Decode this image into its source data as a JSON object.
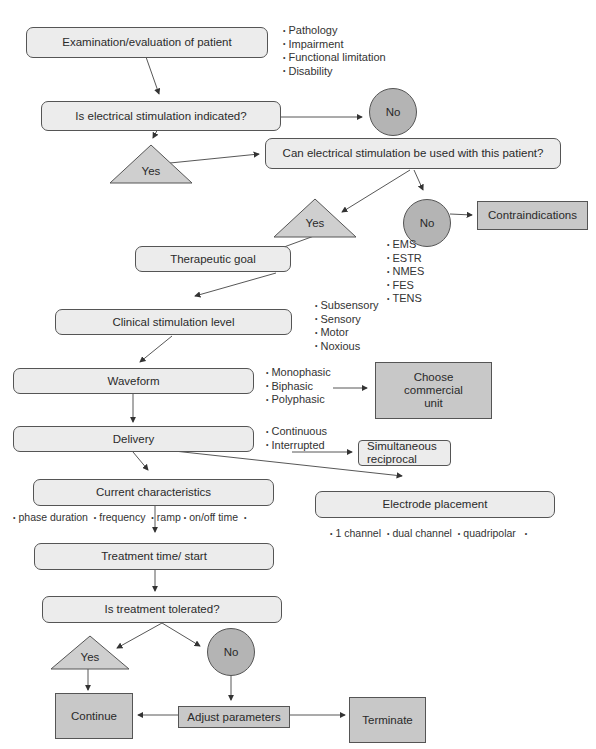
{
  "diagram": {
    "type": "flowchart",
    "colors": {
      "rounded_fill": "#ececec",
      "rect_fill": "#c8c8c8",
      "circle_fill": "#b4b4b4",
      "triangle_fill": "#cfcfcf",
      "stroke": "#555555"
    },
    "nodes": {
      "examination": "Examination/evaluation of patient",
      "es_indicated": "Is electrical stimulation indicated?",
      "no_1": "No",
      "yes_1": "Yes",
      "can_use": "Can electrical stimulation be used with this patient?",
      "yes_2": "Yes",
      "no_2": "No",
      "contraindications": "Contraindications",
      "therapeutic_goal": "Therapeutic goal",
      "clinical_level": "Clinical stimulation level",
      "waveform": "Waveform",
      "choose_unit": "Choose commercial unit",
      "delivery": "Delivery",
      "simultaneous": "Simultaneous reciprocal",
      "current_characteristics": "Current characteristics",
      "electrode_placement": "Electrode placement",
      "treatment_time": "Treatment time/ start",
      "tolerated": "Is treatment tolerated?",
      "yes_3": "Yes",
      "no_3": "No",
      "continue": "Continue",
      "adjust": "Adjust parameters",
      "terminate": "Terminate"
    },
    "lists": {
      "examination_factors": [
        "Pathology",
        "Impairment",
        "Functional limitation",
        "Disability"
      ],
      "goals": [
        "EMS",
        "ESTR",
        "NMES",
        "FES",
        "TENS"
      ],
      "levels": [
        "Subsensory",
        "Sensory",
        "Motor",
        "Noxious"
      ],
      "waveforms": [
        "Monophasic",
        "Biphasic",
        "Polyphasic"
      ],
      "delivery_modes": [
        "Continuous",
        "Interrupted"
      ],
      "current_params": [
        "phase duration",
        "frequency",
        "ramp",
        "on/off time"
      ],
      "electrode_configs": [
        "1 channel",
        "dual channel",
        "quadripolar"
      ]
    }
  }
}
